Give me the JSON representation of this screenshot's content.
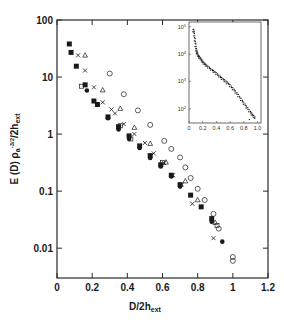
{
  "chart_data": {
    "type": "scatter",
    "title": "",
    "xlabel": "D/2h_ext",
    "xlabel_main": "D/2h",
    "xlabel_sub": "ext",
    "ylabel": "E (D) ρa^-3/2 /2h_ext",
    "ylabel_parts": {
      "main": "E (D) ρ",
      "sub_a": "a",
      "sup": "-3/2",
      "tail": "/2h",
      "sub_ext": "ext"
    },
    "xlim": [
      0,
      1.2
    ],
    "ylim": [
      0.003,
      100
    ],
    "yscale": "log",
    "grid": false,
    "legend": "none",
    "x_ticks": [
      "0",
      "0.2",
      "0.4",
      "0.6",
      "0.8",
      "1",
      "1.2"
    ],
    "y_ticks": [
      "100",
      "10",
      "1",
      "0.1",
      "0.01"
    ],
    "series": [
      {
        "name": "filled squares",
        "marker": "filled-square",
        "x": [
          0.07,
          0.08,
          0.11,
          0.16,
          0.21,
          0.23,
          0.29,
          0.35,
          0.41,
          0.47,
          0.53,
          0.59,
          0.65,
          0.7,
          0.76,
          0.82,
          0.88
        ],
        "y": [
          38,
          27,
          15.5,
          7.3,
          3.8,
          3.3,
          2.0,
          1.35,
          0.93,
          0.62,
          0.42,
          0.29,
          0.19,
          0.13,
          0.085,
          0.053,
          0.033
        ]
      },
      {
        "name": "filled circles",
        "marker": "filled-circle",
        "x": [
          0.17,
          0.29,
          0.35,
          0.41,
          0.47,
          0.53,
          0.59,
          0.65,
          0.7,
          0.88,
          0.94
        ],
        "y": [
          5.8,
          1.9,
          1.2,
          0.82,
          0.57,
          0.38,
          0.27,
          0.18,
          0.12,
          0.029,
          0.013
        ]
      },
      {
        "name": "crosses",
        "marker": "cross",
        "x": [
          0.12,
          0.16,
          0.21,
          0.26,
          0.31,
          0.33,
          0.38,
          0.44,
          0.5,
          0.55,
          0.61,
          0.66,
          0.71,
          0.77,
          0.89
        ],
        "y": [
          24,
          13,
          6.6,
          3.6,
          2.7,
          2.3,
          1.5,
          1.0,
          0.7,
          0.46,
          0.31,
          0.19,
          0.13,
          0.06,
          0.015
        ]
      },
      {
        "name": "open triangles",
        "marker": "open-triangle",
        "x": [
          0.16,
          0.26,
          0.36,
          0.44,
          0.53,
          0.62,
          0.73,
          0.8,
          0.9
        ],
        "y": [
          24,
          5.9,
          2.8,
          1.3,
          0.68,
          0.32,
          0.15,
          0.07,
          0.028
        ]
      },
      {
        "name": "open circles",
        "marker": "open-circle",
        "x": [
          0.3,
          0.38,
          0.46,
          0.53,
          0.61,
          0.65,
          0.7,
          0.73,
          0.76,
          0.8,
          0.84,
          0.89,
          0.92,
          1.0,
          1.0
        ],
        "y": [
          11.5,
          5.0,
          2.6,
          1.45,
          0.76,
          0.55,
          0.39,
          0.26,
          0.17,
          0.11,
          0.07,
          0.04,
          0.022,
          0.007,
          0.006
        ]
      },
      {
        "name": "open squares",
        "marker": "open-square",
        "x": [
          0.14,
          0.36,
          0.42,
          0.6,
          0.91
        ],
        "y": [
          6.9,
          1.4,
          0.82,
          0.32,
          0.025
        ]
      }
    ],
    "inset": {
      "type": "scatter",
      "xlim": [
        0,
        1.05
      ],
      "ylim": [
        30,
        150000
      ],
      "yscale": "log",
      "x_ticks": [
        "0",
        "0.2",
        "0.4",
        "0.6",
        "0.8",
        "1.0"
      ],
      "y_ticks": [
        "10^5",
        "10^4",
        "10^3",
        "10^2"
      ],
      "y_tick_values": [
        100000,
        10000,
        1000,
        100
      ],
      "series": [
        {
          "name": "collapsed data",
          "marker": "small-dot",
          "x": [
            0.06,
            0.07,
            0.08,
            0.09,
            0.1,
            0.11,
            0.12,
            0.14,
            0.16,
            0.18,
            0.2,
            0.23,
            0.26,
            0.3,
            0.34,
            0.38,
            0.42,
            0.46,
            0.5,
            0.54,
            0.58,
            0.62,
            0.66,
            0.7,
            0.74,
            0.78,
            0.82,
            0.86,
            0.9,
            0.93,
            0.96,
            0.88
          ],
          "y": [
            80000,
            60000,
            40000,
            25000,
            16000,
            12000,
            10000,
            8000,
            7000,
            6000,
            5000,
            4200,
            3600,
            3000,
            2500,
            2100,
            1700,
            1400,
            1150,
            950,
            780,
            600,
            460,
            340,
            250,
            180,
            130,
            95,
            70,
            55,
            45,
            40
          ]
        }
      ]
    }
  }
}
